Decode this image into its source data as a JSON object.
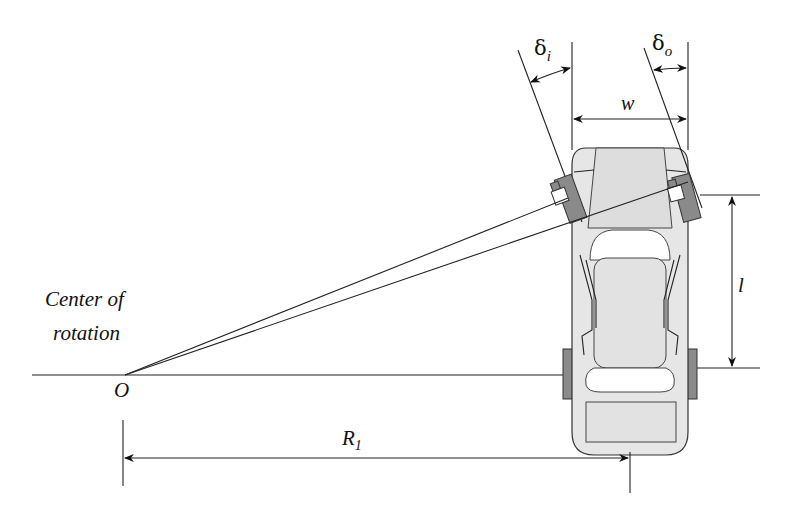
{
  "diagram": {
    "labels": {
      "center_of_rotation_line1": "Center of",
      "center_of_rotation_line2": "rotation",
      "origin": "O",
      "inner_steer_angle": "δ",
      "inner_steer_angle_sub": "i",
      "outer_steer_angle": "δ",
      "outer_steer_angle_sub": "o",
      "track_width": "w",
      "wheelbase": "l",
      "radius": "R",
      "radius_sub": "1"
    },
    "colors": {
      "line": "#222222",
      "car_body": "#e6e6e6",
      "tire": "#8a8a8a",
      "background": "#ffffff"
    }
  }
}
